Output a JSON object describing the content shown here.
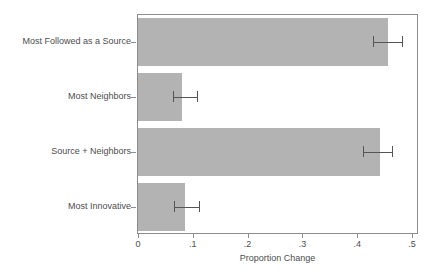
{
  "chart_data": {
    "type": "bar",
    "orientation": "horizontal",
    "title": "",
    "xlabel": "Proportion Change",
    "ylabel": "",
    "categories": [
      "Most Followed as a Source",
      "Most Neighbors",
      "Source + Neighbors",
      "Most Innovative"
    ],
    "values": [
      0.456,
      0.081,
      0.442,
      0.085
    ],
    "errors_low": [
      0.429,
      0.063,
      0.411,
      0.065
    ],
    "errors_high": [
      0.482,
      0.107,
      0.464,
      0.111
    ],
    "xlim": [
      0,
      0.5
    ],
    "xticks": [
      0,
      0.1,
      0.2,
      0.3,
      0.4,
      0.5
    ],
    "xticklabels": [
      "0",
      ".1",
      ".2",
      ".3",
      ".4",
      ".5"
    ],
    "grid": false,
    "legend": null,
    "bar_color": "#b3b3b3",
    "error_color": "#555555",
    "frame_color": "#8d8d8d"
  }
}
